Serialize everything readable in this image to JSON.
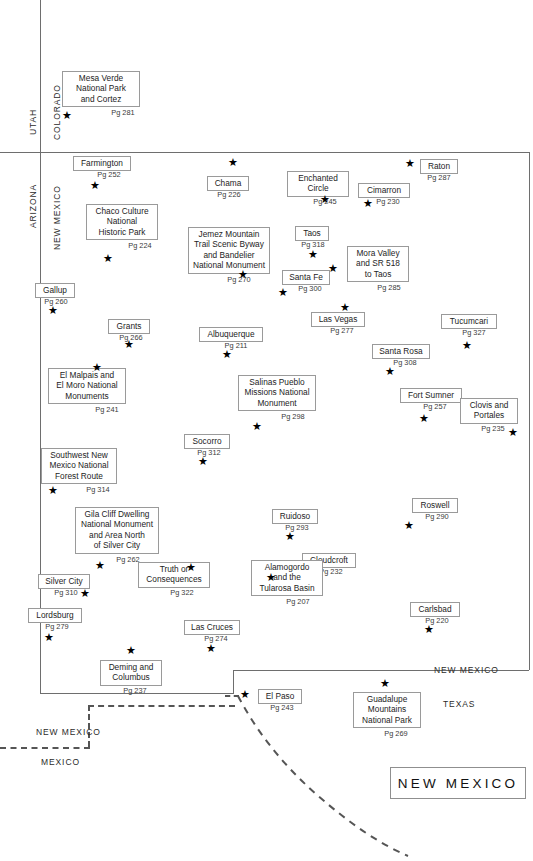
{
  "map": {
    "title": "NEW MEXICO",
    "state_labels": [
      {
        "name": "utah",
        "text": "UTAH",
        "x": 28,
        "y": 135,
        "rot": true
      },
      {
        "name": "colorado",
        "text": "COLORADO",
        "x": 52,
        "y": 140,
        "rot": true
      },
      {
        "name": "arizona",
        "text": "ARIZONA",
        "x": 28,
        "y": 228,
        "rot": true
      },
      {
        "name": "new-mexico-left",
        "text": "NEW MEXICO",
        "x": 52,
        "y": 250,
        "rot": true
      },
      {
        "name": "new-mexico-right",
        "text": "NEW MEXICO",
        "x": 434,
        "y": 665,
        "rot": false
      },
      {
        "name": "texas",
        "text": "TEXAS",
        "x": 443,
        "y": 699,
        "rot": false
      },
      {
        "name": "new-mexico-bottom",
        "text": "NEW MEXICO",
        "x": 36,
        "y": 727,
        "rot": false
      },
      {
        "name": "mexico",
        "text": "MEXICO",
        "x": 41,
        "y": 757,
        "rot": false
      }
    ],
    "points": [
      {
        "id": "mesa-verde",
        "label": "Mesa Verde\nNational Park\nand Cortez",
        "page": "Pg 281",
        "bx": 62,
        "by": 71,
        "bw": 78,
        "bh": 36,
        "px": 84,
        "py": 108,
        "sx": 62,
        "sy": 110
      },
      {
        "id": "farmington",
        "label": "Farmington",
        "page": "Pg 252",
        "bx": 73,
        "by": 156,
        "bw": 58,
        "bh": 13,
        "px": 80,
        "py": 170,
        "sx": 90,
        "sy": 180
      },
      {
        "id": "chama",
        "label": "Chama",
        "page": "Pg 226",
        "bx": 207,
        "by": 176,
        "bw": 42,
        "bh": 13,
        "px": 208,
        "py": 190,
        "sx": 228,
        "sy": 157
      },
      {
        "id": "enchanted-circle",
        "label": "Enchanted\nCircle",
        "bx": 287,
        "by": 171,
        "bw": 62,
        "bh": 25,
        "page": "Pg 245",
        "px": 294,
        "py": 197,
        "sx": 320,
        "sy": 194
      },
      {
        "id": "cimarron",
        "label": "Cimarron",
        "page": "Pg 230",
        "bx": 358,
        "by": 183,
        "bw": 52,
        "bh": 13,
        "px": 362,
        "py": 197,
        "sx": 363,
        "sy": 198
      },
      {
        "id": "raton",
        "label": "Raton",
        "page": "Pg 287",
        "bx": 420,
        "by": 159,
        "bw": 38,
        "bh": 13,
        "px": 420,
        "py": 173,
        "sx": 405,
        "sy": 158
      },
      {
        "id": "chaco-culture",
        "label": "Chaco Culture\nNational\nHistoric Park",
        "page": "Pg 224",
        "bx": 86,
        "by": 204,
        "bw": 72,
        "bh": 36,
        "px": 104,
        "py": 241,
        "sx": 103,
        "sy": 253
      },
      {
        "id": "jemez",
        "label": "Jemez Mountain\nTrail Scenic Byway\nand Bandelier\nNational Monument",
        "page": "Pg 270",
        "bx": 188,
        "by": 227,
        "bw": 82,
        "bh": 47,
        "px": 198,
        "py": 275,
        "sx": 238,
        "sy": 269
      },
      {
        "id": "taos",
        "label": "Taos",
        "page": "Pg 318",
        "bx": 295,
        "by": 226,
        "bw": 34,
        "bh": 13,
        "px": 296,
        "py": 240,
        "sx": 308,
        "sy": 249
      },
      {
        "id": "mora-valley",
        "label": "Mora Valley\nand SR 518\nto Taos",
        "page": "Pg 285",
        "bx": 347,
        "by": 246,
        "bw": 62,
        "bh": 36,
        "px": 358,
        "py": 283,
        "sx": 328,
        "sy": 263
      },
      {
        "id": "santa-fe",
        "label": "Santa Fe",
        "page": "Pg 300",
        "bx": 282,
        "by": 270,
        "bw": 48,
        "bh": 13,
        "px": 286,
        "py": 284,
        "sx": 278,
        "sy": 287
      },
      {
        "id": "gallup",
        "label": "Gallup",
        "page": "Pg 260",
        "bx": 35,
        "by": 283,
        "bw": 40,
        "bh": 13,
        "px": 36,
        "py": 297,
        "sx": 48,
        "sy": 305
      },
      {
        "id": "las-vegas",
        "label": "Las Vegas",
        "page": "Pg 277",
        "bx": 311,
        "by": 312,
        "bw": 54,
        "bh": 13,
        "px": 315,
        "py": 326,
        "sx": 340,
        "sy": 302
      },
      {
        "id": "grants",
        "label": "Grants",
        "page": "Pg 266",
        "bx": 108,
        "by": 319,
        "bw": 42,
        "bh": 13,
        "px": 110,
        "py": 333,
        "sx": 124,
        "sy": 339
      },
      {
        "id": "albuquerque",
        "label": "Albuquerque",
        "page": "Pg 211",
        "bx": 199,
        "by": 327,
        "bw": 64,
        "bh": 13,
        "px": 204,
        "py": 341,
        "sx": 222,
        "sy": 349
      },
      {
        "id": "tucumcari",
        "label": "Tucumcari",
        "page": "Pg 327",
        "bx": 441,
        "by": 314,
        "bw": 56,
        "bh": 13,
        "px": 446,
        "py": 328,
        "sx": 462,
        "sy": 340
      },
      {
        "id": "santa-rosa",
        "label": "Santa Rosa",
        "page": "Pg 308",
        "bx": 372,
        "by": 344,
        "bw": 58,
        "bh": 13,
        "px": 376,
        "py": 358,
        "sx": 385,
        "sy": 366
      },
      {
        "id": "el-malpais",
        "label": "El Malpais and\nEl Moro National\nMonuments",
        "page": "Pg 241",
        "bx": 48,
        "by": 368,
        "bw": 78,
        "bh": 36,
        "px": 68,
        "py": 405,
        "sx": 92,
        "sy": 362
      },
      {
        "id": "salinas-pueblo",
        "label": "Salinas Pueblo\nMissions National\nMonument",
        "page": "Pg 298",
        "bx": 238,
        "by": 375,
        "bw": 78,
        "bh": 36,
        "px": 254,
        "py": 412,
        "sx": 252,
        "sy": 421
      },
      {
        "id": "fort-sumner",
        "label": "Fort Sumner",
        "page": "Pg 257",
        "bx": 400,
        "by": 388,
        "bw": 62,
        "bh": 13,
        "px": 404,
        "py": 402,
        "sx": 419,
        "sy": 413
      },
      {
        "id": "clovis-portales",
        "label": "Clovis and\nPortales",
        "page": "Pg 235",
        "bx": 460,
        "by": 398,
        "bw": 58,
        "bh": 25,
        "px": 464,
        "py": 424,
        "sx": 508,
        "sy": 427
      },
      {
        "id": "socorro",
        "label": "Socorro",
        "page": "Pg 312",
        "bx": 184,
        "by": 434,
        "bw": 46,
        "bh": 13,
        "px": 186,
        "py": 448,
        "sx": 198,
        "sy": 456
      },
      {
        "id": "southwest-nm",
        "label": "Southwest New\nMexico National\nForest Route",
        "page": "Pg 314",
        "bx": 41,
        "by": 448,
        "bw": 76,
        "bh": 36,
        "px": 60,
        "py": 485,
        "sx": 48,
        "sy": 485
      },
      {
        "id": "roswell",
        "label": "Roswell",
        "page": "Pg 290",
        "bx": 412,
        "by": 498,
        "bw": 46,
        "bh": 13,
        "px": 414,
        "py": 512,
        "sx": 404,
        "sy": 520
      },
      {
        "id": "gila-cliff",
        "label": "Gila Cliff Dwelling\nNational Monument\nand Area North\nof Silver City",
        "page": "Pg 262",
        "bx": 75,
        "by": 507,
        "bw": 84,
        "bh": 47,
        "px": 86,
        "py": 555,
        "sx": 95,
        "sy": 560
      },
      {
        "id": "ruidoso",
        "label": "Ruidoso",
        "page": "Pg 293",
        "bx": 272,
        "by": 509,
        "bw": 46,
        "bh": 13,
        "px": 274,
        "py": 523,
        "sx": 285,
        "sy": 531
      },
      {
        "id": "cloudcroft",
        "label": "Cloudcroft",
        "page": "Pg 232",
        "bx": 302,
        "by": 553,
        "bw": 54,
        "bh": 13,
        "px": 304,
        "py": 567,
        "sx": 308,
        "sy": 575
      },
      {
        "id": "truth-consequences",
        "label": "Truth or\nConsequences",
        "page": "Pg 322",
        "bx": 138,
        "by": 562,
        "bw": 72,
        "bh": 25,
        "px": 146,
        "py": 588,
        "sx": 186,
        "sy": 562
      },
      {
        "id": "silver-city",
        "label": "Silver City",
        "page": "Pg 310",
        "bx": 38,
        "by": 574,
        "bw": 52,
        "bh": 13,
        "px": 40,
        "py": 588,
        "sx": 80,
        "sy": 588
      },
      {
        "id": "alamogordo",
        "label": "Alamogordo\nand the\nTularosa Basin",
        "page": "Pg 207",
        "bx": 251,
        "by": 560,
        "bw": 72,
        "bh": 36,
        "px": 262,
        "py": 597,
        "sx": 266,
        "sy": 572
      },
      {
        "id": "carlsbad",
        "label": "Carlsbad",
        "page": "Pg 220",
        "bx": 410,
        "by": 602,
        "bw": 50,
        "bh": 13,
        "px": 412,
        "py": 616,
        "sx": 424,
        "sy": 624
      },
      {
        "id": "lordsburg",
        "label": "Lordsburg",
        "page": "Pg 279",
        "bx": 28,
        "by": 608,
        "bw": 54,
        "bh": 13,
        "px": 30,
        "py": 622,
        "sx": 44,
        "sy": 632
      },
      {
        "id": "las-cruces",
        "label": "Las Cruces",
        "page": "Pg 274",
        "bx": 184,
        "by": 620,
        "bw": 56,
        "bh": 13,
        "px": 188,
        "py": 634,
        "sx": 206,
        "sy": 643
      },
      {
        "id": "deming-columbus",
        "label": "Deming and\nColumbus",
        "page": "Pg 237",
        "bx": 100,
        "by": 660,
        "bw": 62,
        "bh": 25,
        "px": 104,
        "py": 686,
        "sx": 126,
        "sy": 645
      },
      {
        "id": "el-paso",
        "label": "El Paso",
        "page": "Pg 243",
        "bx": 258,
        "by": 689,
        "bw": 44,
        "bh": 13,
        "px": 260,
        "py": 703,
        "sx": 240,
        "sy": 689
      },
      {
        "id": "guadalupe",
        "label": "Guadalupe\nMountains\nNational Park",
        "page": "Pg 269",
        "bx": 353,
        "by": 692,
        "bw": 68,
        "bh": 36,
        "px": 362,
        "py": 729,
        "sx": 380,
        "sy": 678
      }
    ]
  }
}
